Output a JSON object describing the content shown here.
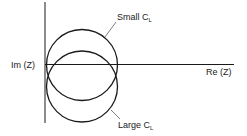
{
  "diagram": {
    "type": "nyquist-impedance-plot",
    "axes": {
      "x_label": "Re (Z)",
      "y_label": "Im (Z)"
    },
    "curves": [
      {
        "label_main": "Small C",
        "label_sub": "L",
        "description": "upper circle"
      },
      {
        "label_main": "Large C",
        "label_sub": "L",
        "description": "lower circle"
      }
    ],
    "colors": {
      "stroke": "#1a1a1a",
      "background": "#ffffff"
    }
  }
}
